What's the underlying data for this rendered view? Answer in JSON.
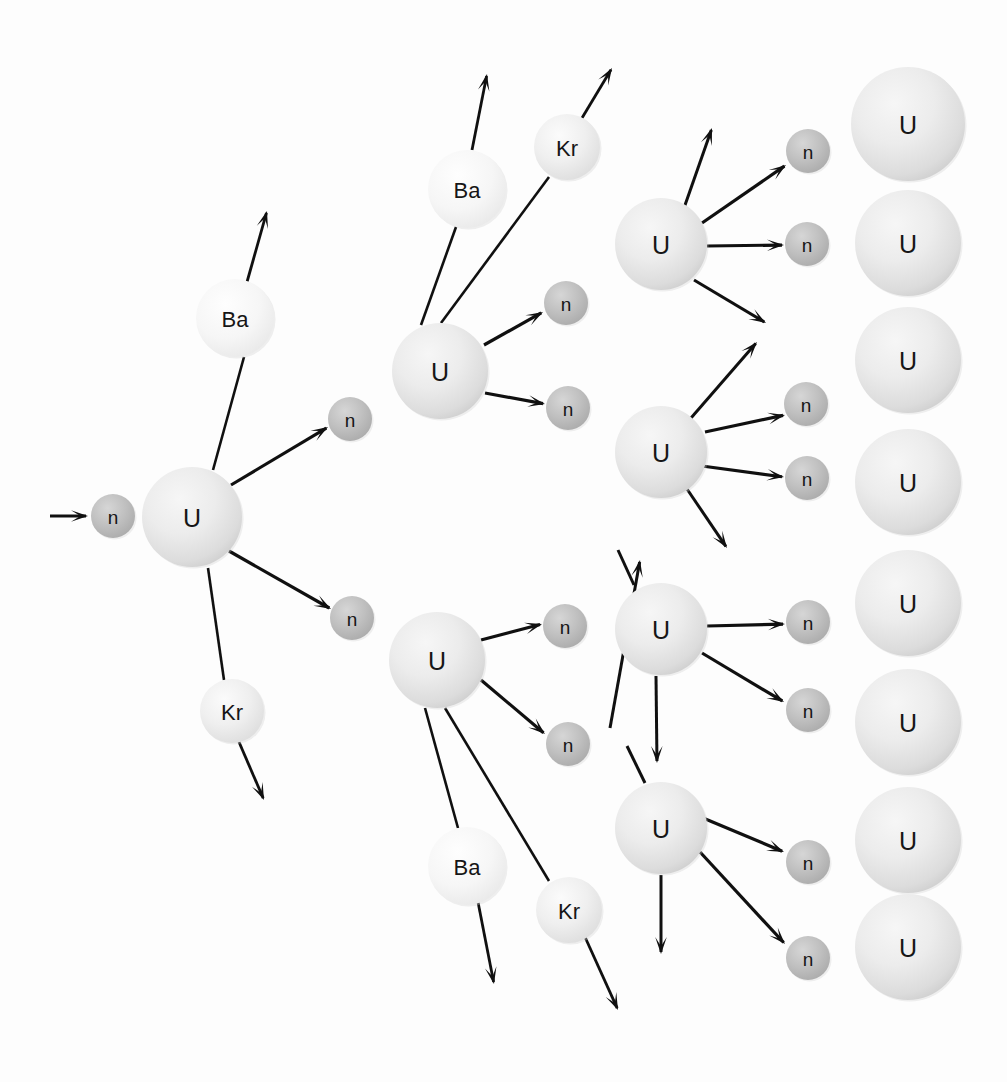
{
  "figure": {
    "background_color": "#fdfdfd",
    "stroke_color": "#101010",
    "label_color": "#161616"
  },
  "species": {
    "uranium": {
      "symbol": "U",
      "name": "uranium-nucleus",
      "fill": "#e6e6e6",
      "radius": 48
    },
    "neutron": {
      "symbol": "n",
      "name": "neutron",
      "fill": "#b9b9b9",
      "radius": 22
    },
    "barium": {
      "symbol": "Ba",
      "name": "barium-fragment",
      "fill": "#f4f4f4",
      "radius": 40
    },
    "krypton": {
      "symbol": "Kr",
      "name": "krypton-fragment",
      "fill": "#ececec",
      "radius": 33
    }
  },
  "atoms": [
    {
      "id": "n-incident",
      "species": "neutron",
      "symbol": "n",
      "cx": 113,
      "cy": 516,
      "r": 22,
      "generation": 0
    },
    {
      "id": "u-gen1",
      "species": "uranium",
      "symbol": "U",
      "cx": 192,
      "cy": 517,
      "r": 50,
      "generation": 1
    },
    {
      "id": "ba-gen1",
      "species": "barium",
      "symbol": "Ba",
      "cx": 235,
      "cy": 318,
      "r": 39,
      "generation": 1
    },
    {
      "id": "kr-gen1",
      "species": "krypton",
      "symbol": "Kr",
      "cx": 232,
      "cy": 711,
      "r": 32,
      "generation": 1
    },
    {
      "id": "n-g1-up",
      "species": "neutron",
      "symbol": "n",
      "cx": 350,
      "cy": 419,
      "r": 22,
      "generation": 1
    },
    {
      "id": "n-g1-dn",
      "species": "neutron",
      "symbol": "n",
      "cx": 352,
      "cy": 618,
      "r": 22,
      "generation": 1
    },
    {
      "id": "u-gen2-top",
      "species": "uranium",
      "symbol": "U",
      "cx": 440,
      "cy": 371,
      "r": 48,
      "generation": 2
    },
    {
      "id": "ba-gen2-top",
      "species": "barium",
      "symbol": "Ba",
      "cx": 467,
      "cy": 189,
      "r": 39,
      "generation": 2
    },
    {
      "id": "kr-gen2-top",
      "species": "krypton",
      "symbol": "Kr",
      "cx": 567,
      "cy": 147,
      "r": 33,
      "generation": 2
    },
    {
      "id": "n-g2t-up",
      "species": "neutron",
      "symbol": "n",
      "cx": 566,
      "cy": 303,
      "r": 22,
      "generation": 2
    },
    {
      "id": "n-g2t-dn",
      "species": "neutron",
      "symbol": "n",
      "cx": 568,
      "cy": 408,
      "r": 22,
      "generation": 2
    },
    {
      "id": "u-gen2-bot",
      "species": "uranium",
      "symbol": "U",
      "cx": 437,
      "cy": 660,
      "r": 48,
      "generation": 2
    },
    {
      "id": "ba-gen2-bot",
      "species": "barium",
      "symbol": "Ba",
      "cx": 467,
      "cy": 866,
      "r": 39,
      "generation": 2
    },
    {
      "id": "kr-gen2-bot",
      "species": "krypton",
      "symbol": "Kr",
      "cx": 569,
      "cy": 910,
      "r": 33,
      "generation": 2
    },
    {
      "id": "n-g2b-up",
      "species": "neutron",
      "symbol": "n",
      "cx": 565,
      "cy": 626,
      "r": 22,
      "generation": 2
    },
    {
      "id": "n-g2b-dn",
      "species": "neutron",
      "symbol": "n",
      "cx": 568,
      "cy": 744,
      "r": 22,
      "generation": 2
    },
    {
      "id": "u-gen3-a",
      "species": "uranium",
      "symbol": "U",
      "cx": 661,
      "cy": 244,
      "r": 46,
      "generation": 3
    },
    {
      "id": "n-g3a-1",
      "species": "neutron",
      "symbol": "n",
      "cx": 808,
      "cy": 151,
      "r": 22,
      "generation": 3
    },
    {
      "id": "n-g3a-2",
      "species": "neutron",
      "symbol": "n",
      "cx": 807,
      "cy": 244,
      "r": 22,
      "generation": 3
    },
    {
      "id": "u-gen3-b",
      "species": "uranium",
      "symbol": "U",
      "cx": 661,
      "cy": 452,
      "r": 46,
      "generation": 3
    },
    {
      "id": "n-g3b-1",
      "species": "neutron",
      "symbol": "n",
      "cx": 806,
      "cy": 404,
      "r": 22,
      "generation": 3
    },
    {
      "id": "n-g3b-2",
      "species": "neutron",
      "symbol": "n",
      "cx": 807,
      "cy": 478,
      "r": 22,
      "generation": 3
    },
    {
      "id": "u-gen3-c",
      "species": "uranium",
      "symbol": "U",
      "cx": 661,
      "cy": 629,
      "r": 46,
      "generation": 3
    },
    {
      "id": "n-g3c-1",
      "species": "neutron",
      "symbol": "n",
      "cx": 808,
      "cy": 622,
      "r": 22,
      "generation": 3
    },
    {
      "id": "n-g3c-2",
      "species": "neutron",
      "symbol": "n",
      "cx": 808,
      "cy": 710,
      "r": 22,
      "generation": 3
    },
    {
      "id": "u-gen3-d",
      "species": "uranium",
      "symbol": "U",
      "cx": 661,
      "cy": 828,
      "r": 46,
      "generation": 3
    },
    {
      "id": "n-g3d-1",
      "species": "neutron",
      "symbol": "n",
      "cx": 808,
      "cy": 862,
      "r": 22,
      "generation": 3
    },
    {
      "id": "n-g3d-2",
      "species": "neutron",
      "symbol": "n",
      "cx": 808,
      "cy": 958,
      "r": 22,
      "generation": 3
    },
    {
      "id": "u-target-1",
      "species": "uranium",
      "symbol": "U",
      "cx": 908,
      "cy": 124,
      "r": 57,
      "generation": 4
    },
    {
      "id": "u-target-2",
      "species": "uranium",
      "symbol": "U",
      "cx": 908,
      "cy": 243,
      "r": 53,
      "generation": 4
    },
    {
      "id": "u-target-3",
      "species": "uranium",
      "symbol": "U",
      "cx": 908,
      "cy": 360,
      "r": 53,
      "generation": 4
    },
    {
      "id": "u-target-4",
      "species": "uranium",
      "symbol": "U",
      "cx": 908,
      "cy": 482,
      "r": 53,
      "generation": 4
    },
    {
      "id": "u-target-5",
      "species": "uranium",
      "symbol": "U",
      "cx": 908,
      "cy": 603,
      "r": 53,
      "generation": 4
    },
    {
      "id": "u-target-6",
      "species": "uranium",
      "symbol": "U",
      "cx": 908,
      "cy": 722,
      "r": 53,
      "generation": 4
    },
    {
      "id": "u-target-7",
      "species": "uranium",
      "symbol": "U",
      "cx": 908,
      "cy": 840,
      "r": 53,
      "generation": 4
    },
    {
      "id": "u-target-8",
      "species": "uranium",
      "symbol": "U",
      "cx": 908,
      "cy": 947,
      "r": 53,
      "generation": 4
    }
  ],
  "rays": [
    {
      "id": "ray-incident",
      "kind": "neutron-arrow",
      "x1": 50,
      "y1": 516,
      "x2": 88,
      "y2": 516,
      "arrow": true,
      "width": 3.0
    },
    {
      "id": "ray-g1-n-up",
      "kind": "neutron-arrow",
      "x1": 231,
      "y1": 485,
      "x2": 328,
      "y2": 427,
      "arrow": true,
      "width": 3.2
    },
    {
      "id": "ray-g1-n-dn",
      "kind": "neutron-arrow",
      "x1": 229,
      "y1": 551,
      "x2": 331,
      "y2": 609,
      "arrow": true,
      "width": 3.2
    },
    {
      "id": "ray-g1-ba-stem",
      "kind": "fragment-stem",
      "x1": 213,
      "y1": 470,
      "x2": 244,
      "y2": 357,
      "arrow": false,
      "width": 2.6
    },
    {
      "id": "ray-g1-ba-tail",
      "kind": "fragment-arrow",
      "x1": 247,
      "y1": 282,
      "x2": 267,
      "y2": 211,
      "arrow": true,
      "width": 2.8
    },
    {
      "id": "ray-g1-kr-stem",
      "kind": "fragment-stem",
      "x1": 208,
      "y1": 568,
      "x2": 224,
      "y2": 680,
      "arrow": false,
      "width": 2.6
    },
    {
      "id": "ray-g1-kr-tail",
      "kind": "fragment-arrow",
      "x1": 239,
      "y1": 742,
      "x2": 264,
      "y2": 800,
      "arrow": true,
      "width": 2.8
    },
    {
      "id": "ray-g2t-ba-stem",
      "kind": "fragment-stem",
      "x1": 421,
      "y1": 325,
      "x2": 456,
      "y2": 227,
      "arrow": false,
      "width": 2.6
    },
    {
      "id": "ray-g2t-ba-tail",
      "kind": "fragment-arrow",
      "x1": 472,
      "y1": 150,
      "x2": 487,
      "y2": 74,
      "arrow": true,
      "width": 2.8
    },
    {
      "id": "ray-g2t-kr-stem",
      "kind": "fragment-stem",
      "x1": 441,
      "y1": 323,
      "x2": 549,
      "y2": 177,
      "arrow": false,
      "width": 2.6
    },
    {
      "id": "ray-g2t-kr-tail",
      "kind": "fragment-arrow",
      "x1": 582,
      "y1": 118,
      "x2": 612,
      "y2": 68,
      "arrow": true,
      "width": 2.8
    },
    {
      "id": "ray-g2t-n-up",
      "kind": "neutron-arrow",
      "x1": 484,
      "y1": 345,
      "x2": 543,
      "y2": 312,
      "arrow": true,
      "width": 3.2
    },
    {
      "id": "ray-g2t-n-dn",
      "kind": "neutron-arrow",
      "x1": 485,
      "y1": 393,
      "x2": 545,
      "y2": 404,
      "arrow": true,
      "width": 3.2
    },
    {
      "id": "ray-g2b-n-up",
      "kind": "neutron-arrow",
      "x1": 481,
      "y1": 640,
      "x2": 542,
      "y2": 624,
      "arrow": true,
      "width": 3.2
    },
    {
      "id": "ray-g2b-n-dn",
      "kind": "neutron-arrow",
      "x1": 481,
      "y1": 680,
      "x2": 545,
      "y2": 734,
      "arrow": true,
      "width": 3.2
    },
    {
      "id": "ray-g2b-ba-stem",
      "kind": "fragment-stem",
      "x1": 425,
      "y1": 708,
      "x2": 458,
      "y2": 828,
      "arrow": false,
      "width": 2.6
    },
    {
      "id": "ray-g2b-ba-tail",
      "kind": "fragment-arrow",
      "x1": 478,
      "y1": 902,
      "x2": 494,
      "y2": 984,
      "arrow": true,
      "width": 2.8
    },
    {
      "id": "ray-g2b-kr-stem",
      "kind": "fragment-stem",
      "x1": 445,
      "y1": 708,
      "x2": 549,
      "y2": 881,
      "arrow": false,
      "width": 2.6
    },
    {
      "id": "ray-g2b-kr-tail",
      "kind": "fragment-arrow",
      "x1": 585,
      "y1": 937,
      "x2": 618,
      "y2": 1010,
      "arrow": true,
      "width": 2.8
    },
    {
      "id": "ray-g3a-n1",
      "kind": "neutron-arrow",
      "x1": 702,
      "y1": 223,
      "x2": 786,
      "y2": 165,
      "arrow": true,
      "width": 3.2
    },
    {
      "id": "ray-g3a-n2",
      "kind": "neutron-arrow",
      "x1": 707,
      "y1": 246,
      "x2": 784,
      "y2": 245,
      "arrow": true,
      "width": 3.2
    },
    {
      "id": "ray-g3a-fr1",
      "kind": "fragment-arrow",
      "x1": 684,
      "y1": 208,
      "x2": 712,
      "y2": 128,
      "arrow": true,
      "width": 3.0
    },
    {
      "id": "ray-g3a-fr2",
      "kind": "fragment-arrow",
      "x1": 694,
      "y1": 280,
      "x2": 766,
      "y2": 323,
      "arrow": true,
      "width": 3.0
    },
    {
      "id": "ray-g3b-n1",
      "kind": "neutron-arrow",
      "x1": 705,
      "y1": 432,
      "x2": 785,
      "y2": 415,
      "arrow": true,
      "width": 3.2
    },
    {
      "id": "ray-g3b-n2",
      "kind": "neutron-arrow",
      "x1": 702,
      "y1": 466,
      "x2": 784,
      "y2": 477,
      "arrow": true,
      "width": 3.2
    },
    {
      "id": "ray-g3b-fr1",
      "kind": "fragment-arrow",
      "x1": 691,
      "y1": 418,
      "x2": 757,
      "y2": 342,
      "arrow": true,
      "width": 3.0
    },
    {
      "id": "ray-g3b-fr2",
      "kind": "fragment-arrow",
      "x1": 687,
      "y1": 489,
      "x2": 727,
      "y2": 548,
      "arrow": true,
      "width": 3.0
    },
    {
      "id": "ray-g3b-in",
      "kind": "fragment-arrow",
      "x1": 610,
      "y1": 728,
      "x2": 640,
      "y2": 560,
      "arrow": true,
      "width": 3.0
    },
    {
      "id": "ray-g3c-n1",
      "kind": "neutron-arrow",
      "x1": 707,
      "y1": 626,
      "x2": 785,
      "y2": 624,
      "arrow": true,
      "width": 3.2
    },
    {
      "id": "ray-g3c-n2",
      "kind": "neutron-arrow",
      "x1": 702,
      "y1": 653,
      "x2": 784,
      "y2": 702,
      "arrow": true,
      "width": 3.2
    },
    {
      "id": "ray-g3c-fr1",
      "kind": "fragment-stem",
      "x1": 634,
      "y1": 585,
      "x2": 618,
      "y2": 550,
      "arrow": false,
      "width": 3.0
    },
    {
      "id": "ray-g3c-fr2",
      "kind": "fragment-arrow",
      "x1": 656,
      "y1": 676,
      "x2": 657,
      "y2": 763,
      "arrow": true,
      "width": 3.0
    },
    {
      "id": "ray-g3d-n1",
      "kind": "neutron-arrow",
      "x1": 703,
      "y1": 818,
      "x2": 784,
      "y2": 852,
      "arrow": true,
      "width": 3.2
    },
    {
      "id": "ray-g3d-n2",
      "kind": "neutron-arrow",
      "x1": 700,
      "y1": 852,
      "x2": 785,
      "y2": 944,
      "arrow": true,
      "width": 3.2
    },
    {
      "id": "ray-g3d-fr1",
      "kind": "fragment-arrow",
      "x1": 661,
      "y1": 875,
      "x2": 661,
      "y2": 954,
      "arrow": true,
      "width": 3.0
    },
    {
      "id": "ray-g3d-fr2",
      "kind": "fragment-stem",
      "x1": 645,
      "y1": 783,
      "x2": 627,
      "y2": 746,
      "arrow": false,
      "width": 3.0
    }
  ],
  "counts": {
    "generation_1_nuclei": 1,
    "generation_2_nuclei": 2,
    "generation_3_nuclei": 4,
    "unreacted_targets": 8,
    "neutrons_per_fission": 2,
    "fragments_per_fission": 2
  }
}
